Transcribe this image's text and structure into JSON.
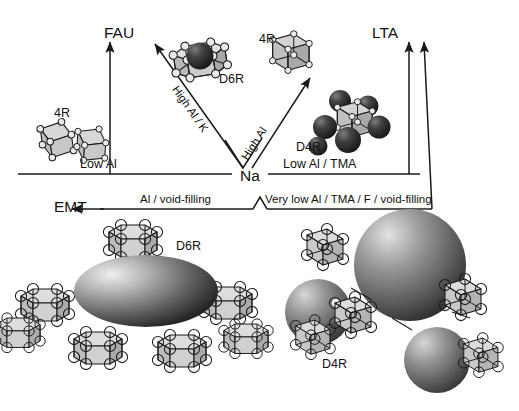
{
  "diagram": {
    "type": "pathway-diagram",
    "center_node": {
      "label": "Na",
      "name": "sodium-hub"
    },
    "products": [
      {
        "id": "fau",
        "label": "FAU",
        "position": "top-left"
      },
      {
        "id": "lta",
        "label": "LTA",
        "position": "top-right"
      },
      {
        "id": "emt",
        "label": "EMT",
        "position": "middle-left"
      }
    ],
    "pathways": [
      {
        "id": "low-al",
        "label": "Low Al",
        "from": "Na",
        "to": "FAU",
        "orientation": "horizontal-left"
      },
      {
        "id": "high-al-k",
        "label": "High Al / K",
        "from": "Na",
        "to": "FAU",
        "orientation": "diagonal-up-left"
      },
      {
        "id": "low-al-tma",
        "label": "Low Al / TMA",
        "from": "Na",
        "to": "LTA",
        "orientation": "horizontal-right"
      },
      {
        "id": "high-al",
        "label": "High Al",
        "from": "Na",
        "to": "LTA",
        "orientation": "diagonal-up-right"
      },
      {
        "id": "al-void-filling",
        "label": "Al / void-filling",
        "from": "Na",
        "to": "EMT",
        "orientation": "horizontal-left-lower"
      },
      {
        "id": "very-low-al",
        "label": "Very low Al / TMA / F / void-filling",
        "from": "Na",
        "to": "LTA",
        "orientation": "horizontal-right-lower"
      }
    ],
    "building_units": [
      {
        "id": "d6r-top",
        "label": "D6R",
        "shape": "hexagonal-prism",
        "cation": "K",
        "caption_x": 219,
        "caption_y": 73
      },
      {
        "id": "fourr-left",
        "label": "4R",
        "shape": "four-ring",
        "cation": null,
        "caption_x": 54,
        "caption_y": 107
      },
      {
        "id": "fourr-right",
        "label": "4R",
        "shape": "four-ring-cube",
        "cation": null,
        "caption_x": 259,
        "caption_y": 33
      },
      {
        "id": "d4r-top",
        "label": "D4R",
        "shape": "double-four-ring",
        "cation": "TMA",
        "caption_x": 296,
        "caption_y": 141
      },
      {
        "id": "d6r-bottom",
        "label": "D6R",
        "shape": "hexagonal-prism",
        "cation": null,
        "caption_x": 176,
        "caption_y": 240
      },
      {
        "id": "d4r-bottom",
        "label": "D4R",
        "shape": "double-four-ring",
        "cation": null,
        "caption_x": 322,
        "caption_y": 358
      }
    ],
    "structures": [
      {
        "id": "emt-framework",
        "name": "emt-cage-assembly",
        "cage": "ellipsoid",
        "linker": "D6R",
        "linker_count": 7
      },
      {
        "id": "lta-framework",
        "name": "lta-cage-assembly",
        "cage": "sphere",
        "linker": "D4R",
        "linker_count": 5
      }
    ],
    "colors": {
      "line": "#1a1a1a",
      "face_light": "#d8d8d8",
      "face_mid": "#bdbdbd",
      "face_dark": "#9a9a9a",
      "node_fill": "#e8e8e8",
      "sphere_dark": "#2b2b2b",
      "sphere_grey": "#8a8a8a",
      "background": "#ffffff"
    }
  }
}
